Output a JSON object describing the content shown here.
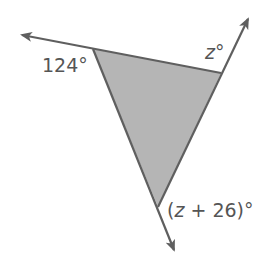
{
  "diagram": {
    "type": "triangle-exterior-angles",
    "fill_color": "#b5b5b5",
    "line_color": "#5f5f5f",
    "label_color": "#555555",
    "vertices": {
      "left": [
        93,
        49
      ],
      "right": [
        221,
        73
      ],
      "bottom": [
        158,
        207
      ]
    },
    "rays": {
      "left_arrow_tip": [
        20,
        34
      ],
      "right_arrow_tip": [
        249,
        17
      ],
      "bottom_arrow_tip": [
        175,
        252
      ]
    },
    "labels": {
      "left_angle": "124°",
      "right_angle_var": "z",
      "right_angle_deg": "°",
      "bottom_open": "(",
      "bottom_var": "z",
      "bottom_rest": " + 26)°"
    }
  }
}
